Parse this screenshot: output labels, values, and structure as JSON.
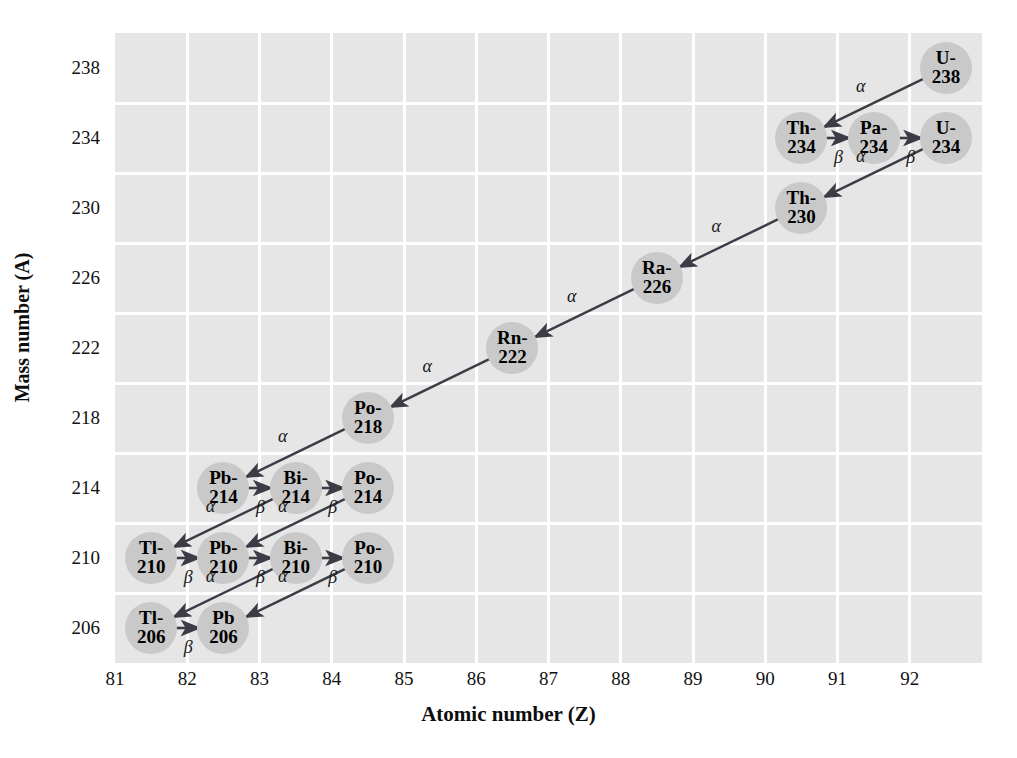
{
  "chart_data": {
    "type": "scatter",
    "title": "",
    "xlabel": "Atomic number (Z)",
    "ylabel": "Mass number (A)",
    "xlim": [
      80.5,
      92.5
    ],
    "ylim": [
      204,
      240
    ],
    "xticks": [
      81,
      82,
      83,
      84,
      85,
      86,
      87,
      88,
      89,
      90,
      91,
      92
    ],
    "yticks": [
      238,
      234,
      230,
      226,
      222,
      218,
      214,
      210,
      206
    ],
    "grid": true,
    "legend": "none",
    "nodes": [
      {
        "id": "U-238",
        "symbol": "U-",
        "mass": "238",
        "z": 92,
        "a": 238
      },
      {
        "id": "Th-234",
        "symbol": "Th-",
        "mass": "234",
        "z": 90,
        "a": 234
      },
      {
        "id": "Pa-234",
        "symbol": "Pa-",
        "mass": "234",
        "z": 91,
        "a": 234
      },
      {
        "id": "U-234",
        "symbol": "U-",
        "mass": "234",
        "z": 92,
        "a": 234
      },
      {
        "id": "Th-230",
        "symbol": "Th-",
        "mass": "230",
        "z": 90,
        "a": 230
      },
      {
        "id": "Ra-226",
        "symbol": "Ra-",
        "mass": "226",
        "z": 88,
        "a": 226
      },
      {
        "id": "Rn-222",
        "symbol": "Rn-",
        "mass": "222",
        "z": 86,
        "a": 222
      },
      {
        "id": "Po-218",
        "symbol": "Po-",
        "mass": "218",
        "z": 84,
        "a": 218
      },
      {
        "id": "Pb-214",
        "symbol": "Pb-",
        "mass": "214",
        "z": 82,
        "a": 214
      },
      {
        "id": "Bi-214",
        "symbol": "Bi-",
        "mass": "214",
        "z": 83,
        "a": 214
      },
      {
        "id": "Po-214",
        "symbol": "Po-",
        "mass": "214",
        "z": 84,
        "a": 214
      },
      {
        "id": "Tl-210",
        "symbol": "Tl-",
        "mass": "210",
        "z": 81,
        "a": 210
      },
      {
        "id": "Pb-210",
        "symbol": "Pb-",
        "mass": "210",
        "z": 82,
        "a": 210
      },
      {
        "id": "Bi-210",
        "symbol": "Bi-",
        "mass": "210",
        "z": 83,
        "a": 210
      },
      {
        "id": "Po-210",
        "symbol": "Po-",
        "mass": "210",
        "z": 84,
        "a": 210
      },
      {
        "id": "Tl-206",
        "symbol": "Tl-",
        "mass": "206",
        "z": 81,
        "a": 206
      },
      {
        "id": "Pb-206",
        "symbol": "Pb",
        "mass": "206",
        "z": 82,
        "a": 206
      }
    ],
    "decays": [
      {
        "from": "U-238",
        "to": "Th-234",
        "mode": "α"
      },
      {
        "from": "Th-234",
        "to": "Pa-234",
        "mode": "β"
      },
      {
        "from": "Pa-234",
        "to": "U-234",
        "mode": "β"
      },
      {
        "from": "U-234",
        "to": "Th-230",
        "mode": "α"
      },
      {
        "from": "Th-230",
        "to": "Ra-226",
        "mode": "α"
      },
      {
        "from": "Ra-226",
        "to": "Rn-222",
        "mode": "α"
      },
      {
        "from": "Rn-222",
        "to": "Po-218",
        "mode": "α"
      },
      {
        "from": "Po-218",
        "to": "Pb-214",
        "mode": "α"
      },
      {
        "from": "Pb-214",
        "to": "Bi-214",
        "mode": "β"
      },
      {
        "from": "Bi-214",
        "to": "Po-214",
        "mode": "β"
      },
      {
        "from": "Bi-214",
        "to": "Tl-210",
        "mode": "α"
      },
      {
        "from": "Po-214",
        "to": "Pb-210",
        "mode": "α"
      },
      {
        "from": "Tl-210",
        "to": "Pb-210",
        "mode": "β"
      },
      {
        "from": "Pb-210",
        "to": "Bi-210",
        "mode": "β"
      },
      {
        "from": "Bi-210",
        "to": "Po-210",
        "mode": "β"
      },
      {
        "from": "Bi-210",
        "to": "Tl-206",
        "mode": "α"
      },
      {
        "from": "Po-210",
        "to": "Pb-206",
        "mode": "α"
      },
      {
        "from": "Tl-206",
        "to": "Pb-206",
        "mode": "β"
      }
    ]
  },
  "style": {
    "node_fill": "#c9c9c9",
    "plot_bg": "#e6e6e6",
    "gridline": "#ffffff",
    "arrow": "#3c3c46",
    "text": "#000000"
  }
}
